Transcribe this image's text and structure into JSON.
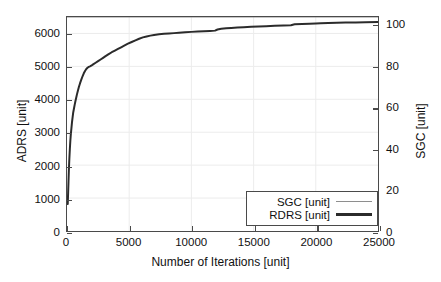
{
  "chart_data": {
    "type": "line",
    "title": "",
    "xlabel": "Number of Iterations [unit]",
    "ylabel": "ADRS [unit]",
    "y2label": "SGC [unit]",
    "xlim": [
      0,
      25000
    ],
    "ylim": [
      0,
      6500
    ],
    "y2lim": [
      0,
      104
    ],
    "grid": true,
    "legend_position": "lower right",
    "xticks": [
      0,
      5000,
      10000,
      15000,
      20000,
      25000
    ],
    "xtick_labels": [
      "0",
      "5000",
      "10000",
      "15000",
      "20000",
      "25000"
    ],
    "yticks": [
      0,
      1000,
      2000,
      3000,
      4000,
      5000,
      6000
    ],
    "ytick_labels": [
      "0",
      "1000",
      "2000",
      "3000",
      "4000",
      "5000",
      "6000"
    ],
    "y2ticks": [
      0,
      20,
      40,
      60,
      80,
      100
    ],
    "y2tick_labels": [
      "0",
      "20",
      "40",
      "60",
      "80",
      "100"
    ],
    "series": [
      {
        "name": "SGC [unit]",
        "axis": "right",
        "color": "#8e8e8e",
        "width": 1.2,
        "x": [
          0,
          25000
        ],
        "y": [
          104,
          104
        ]
      },
      {
        "name": "RDRS [unit]",
        "axis": "left",
        "color": "#2b2b2b",
        "width": 2.0,
        "x": [
          60,
          90,
          120,
          150,
          190,
          230,
          270,
          310,
          350,
          400,
          450,
          500,
          560,
          620,
          680,
          740,
          800,
          880,
          960,
          1050,
          1150,
          1250,
          1350,
          1450,
          1550,
          1650,
          1750,
          1850,
          1950,
          2100,
          2300,
          2500,
          2700,
          2900,
          3100,
          3350,
          3600,
          3850,
          4100,
          4350,
          4600,
          4900,
          5200,
          5500,
          5800,
          6100,
          6400,
          6700,
          7000,
          7400,
          7800,
          8200,
          8600,
          9000,
          9500,
          10000,
          10500,
          11000,
          11500,
          11900,
          12100,
          12400,
          12800,
          13200,
          13700,
          14200,
          14800,
          15400,
          16000,
          16700,
          17400,
          18000,
          18300,
          18900,
          19500,
          20000,
          20400,
          21000,
          21700,
          22400,
          23200,
          24000,
          25000
        ],
        "y": [
          820,
          1150,
          1500,
          1850,
          2200,
          2500,
          2750,
          2950,
          3100,
          3300,
          3450,
          3600,
          3720,
          3840,
          3950,
          4050,
          4150,
          4270,
          4380,
          4490,
          4600,
          4700,
          4790,
          4860,
          4920,
          4960,
          4985,
          5000,
          5020,
          5060,
          5110,
          5160,
          5210,
          5260,
          5310,
          5370,
          5430,
          5480,
          5530,
          5580,
          5630,
          5690,
          5740,
          5790,
          5840,
          5880,
          5910,
          5935,
          5955,
          5975,
          5990,
          6000,
          6010,
          6020,
          6035,
          6048,
          6058,
          6068,
          6078,
          6086,
          6120,
          6140,
          6155,
          6168,
          6180,
          6192,
          6203,
          6213,
          6222,
          6232,
          6241,
          6248,
          6278,
          6288,
          6296,
          6303,
          6310,
          6318,
          6325,
          6330,
          6335,
          6340,
          6345
        ]
      }
    ]
  },
  "axes": {
    "x_title": "Number of Iterations [unit]",
    "y_left_title": "ADRS [unit]",
    "y_right_title": "SGC [unit]"
  },
  "legend": {
    "items": [
      {
        "label": "SGC [unit]"
      },
      {
        "label": "RDRS [unit]"
      }
    ]
  },
  "colors": {
    "frame": "#4a4a4a",
    "grid": "#ececec",
    "sgc_line": "#8e8e8e",
    "rdrs_line": "#2b2b2b",
    "text": "#111111",
    "background": "#ffffff"
  }
}
